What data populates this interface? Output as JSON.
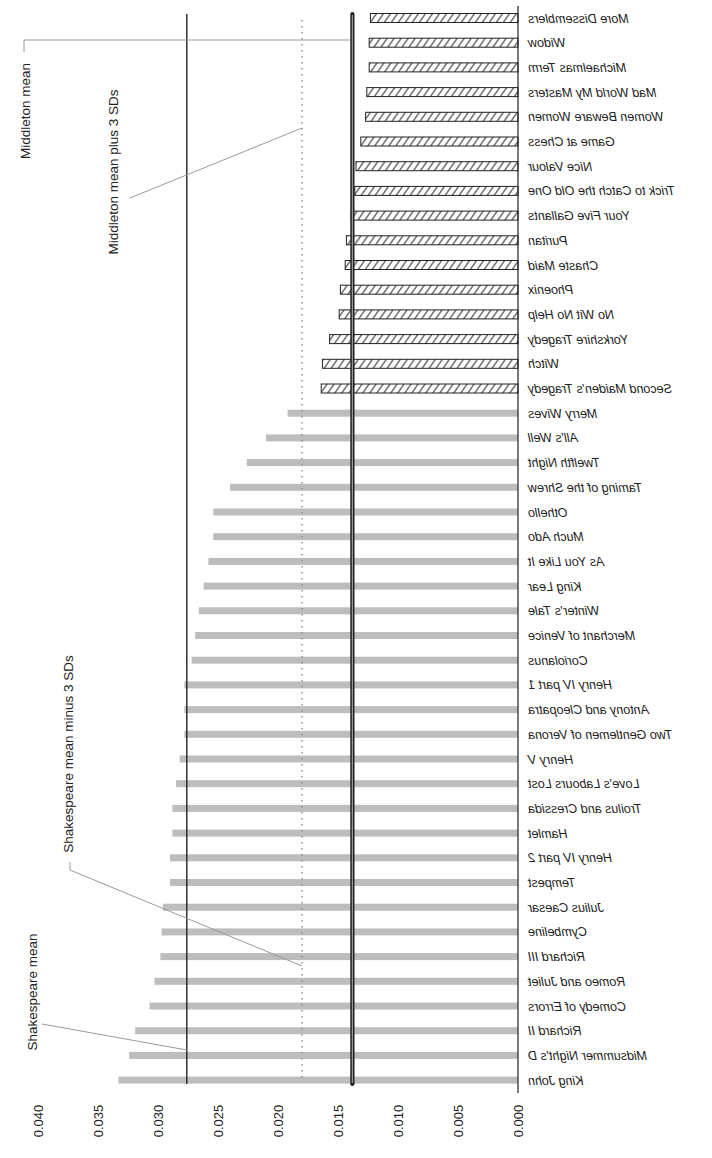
{
  "chart_data": {
    "type": "bar",
    "orientation": "horizontal (rendered rotated/mirrored: bars extend leftward from baseline at right, labels mirrored)",
    "title": "",
    "xlabel": "",
    "ylabel": "",
    "xlim": [
      0.0,
      0.04
    ],
    "x_ticks": [
      "0.000",
      "0.005",
      "0.010",
      "0.015",
      "0.020",
      "0.025",
      "0.030",
      "0.035",
      "0.040"
    ],
    "grid": false,
    "series": [
      {
        "name": "Middleton",
        "style": "hatched",
        "categories": [
          "More Dissemblers",
          "Widow",
          "Michaelmas Term",
          "Mad World My Masters",
          "Women Beware Women",
          "Game at Chess",
          "Nice Valour",
          "Trick to Catch the Old One",
          "Your Five Gallants",
          "Puritan",
          "Chaste Maid",
          "Phoenix",
          "No Wit No Help",
          "Yorkshire Tragedy",
          "Witch",
          "Second Maiden's Tragedy"
        ],
        "values": [
          0.0123,
          0.0124,
          0.0124,
          0.0126,
          0.0127,
          0.0131,
          0.0135,
          0.0136,
          0.0139,
          0.0143,
          0.0144,
          0.0148,
          0.0149,
          0.0157,
          0.0163,
          0.0164
        ]
      },
      {
        "name": "Shakespeare",
        "style": "gray",
        "categories": [
          "Merry Wives",
          "All's Well",
          "Twelfth Night",
          "Taming of the Shrew",
          "Othello",
          "Much Ado",
          "As You Like It",
          "King Lear",
          "Winter's Tale",
          "Merchant of Venice",
          "Coriolanus",
          "Henry IV part 1",
          "Antony and Cleopatra",
          "Two Gentlemen of Verona",
          "Henry V",
          "Love's Labours Lost",
          "Troilus and Cressida",
          "Hamlet",
          "Henry IV part 2",
          "Tempest",
          "Julius Caesar",
          "Cymbeline",
          "Richard III",
          "Romeo and Juliet",
          "Comedy of Errors",
          "Richard II",
          "Midsummer Night's D",
          "King John"
        ],
        "values": [
          0.0192,
          0.021,
          0.0226,
          0.024,
          0.0254,
          0.0254,
          0.0258,
          0.0262,
          0.0266,
          0.0269,
          0.0272,
          0.0278,
          0.0278,
          0.0278,
          0.0282,
          0.0285,
          0.0288,
          0.0288,
          0.029,
          0.029,
          0.0296,
          0.0297,
          0.0298,
          0.0303,
          0.0307,
          0.0319,
          0.0324,
          0.0333
        ]
      }
    ],
    "reference_lines": [
      {
        "name": "Shakespeare mean",
        "value": 0.0276,
        "style": "solid"
      },
      {
        "name": "Shakespeare mean minus 3 SDs",
        "value": 0.018,
        "style": "dotted"
      },
      {
        "name": "Middleton mean plus 3 SDs",
        "value": 0.018,
        "style": "dotted"
      },
      {
        "name": "Middleton mean",
        "value": 0.0138,
        "style": "double"
      }
    ],
    "annotations": [
      "Middleton mean",
      "Middleton mean plus 3 SDs",
      "Shakespeare mean minus 3 SDs",
      "Shakespeare mean"
    ],
    "colors": {
      "shakespeare_bar": "#bdbdbd",
      "middleton_outline": "#222222",
      "lines": "#222222",
      "leader": "#9a9a9a"
    }
  }
}
